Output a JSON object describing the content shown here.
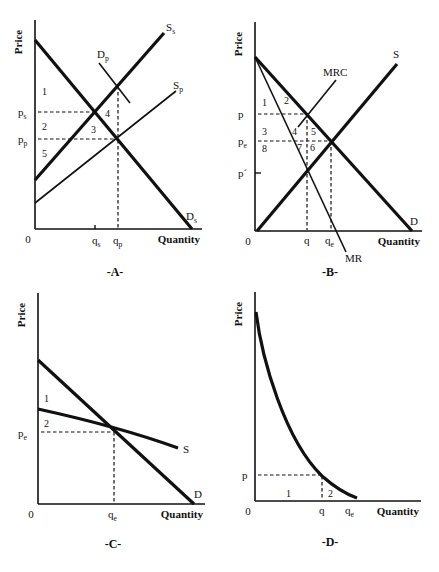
{
  "panels": [
    {
      "id": "A",
      "title": "-A-",
      "axis": {
        "ylabel": "Price",
        "xlabel": "Quantity",
        "origin": "0"
      },
      "frame": {
        "x0": 35,
        "y0": 229,
        "yTop": 20,
        "xRight": 202
      },
      "lines": [
        {
          "name": "Ds",
          "label": "D",
          "sub": "s",
          "x1": 35,
          "y1": 40,
          "x2": 192,
          "y2": 229,
          "w": 3.2,
          "lx": 186,
          "ly": 220
        },
        {
          "name": "Ss",
          "label": "S",
          "sub": "s",
          "x1": 35,
          "y1": 180,
          "x2": 164,
          "y2": 33,
          "w": 3.2,
          "lx": 166,
          "ly": 31
        },
        {
          "name": "Sp",
          "label": "S",
          "sub": "p",
          "x1": 35,
          "y1": 203,
          "x2": 176,
          "y2": 91,
          "w": 1.6,
          "lx": 173,
          "ly": 89
        },
        {
          "name": "Dp",
          "label": "D",
          "sub": "p",
          "x1": 99,
          "y1": 63,
          "x2": 130,
          "y2": 103,
          "w": 1.6,
          "lx": 97,
          "ly": 58
        }
      ],
      "dashed": [
        {
          "x1": 38,
          "y1": 112,
          "x2": 95,
          "y2": 112
        },
        {
          "x1": 38,
          "y1": 139,
          "x2": 117,
          "y2": 139
        },
        {
          "x1": 118,
          "y1": 86,
          "x2": 118,
          "y2": 228
        }
      ],
      "ticks": [
        {
          "x": 95,
          "y1": 225,
          "y2": 229
        }
      ],
      "ylabels": [
        {
          "text": "p",
          "sub": "s",
          "x": 18,
          "y": 116
        },
        {
          "text": "p",
          "sub": "p",
          "x": 18,
          "y": 143
        }
      ],
      "xlabels": [
        {
          "text": "q",
          "sub": "s",
          "x": 92,
          "y": 244
        },
        {
          "text": "q",
          "sub": "p",
          "x": 113,
          "y": 244
        }
      ],
      "regions": [
        {
          "text": "1",
          "x": 42,
          "y": 95
        },
        {
          "text": "4",
          "x": 105,
          "y": 117
        },
        {
          "text": "2",
          "x": 42,
          "y": 130
        },
        {
          "text": "3",
          "x": 91,
          "y": 133
        },
        {
          "text": "5",
          "x": 42,
          "y": 157
        }
      ],
      "titlePos": {
        "x": 115,
        "y": 276
      }
    },
    {
      "id": "B",
      "title": "-B-",
      "axis": {
        "ylabel": "Price",
        "xlabel": "Quantity",
        "origin": "0"
      },
      "frame": {
        "x0": 255,
        "y0": 231,
        "yTop": 22,
        "xRight": 422
      },
      "lines": [
        {
          "name": "D",
          "label": "D",
          "sub": "",
          "x1": 255,
          "y1": 57,
          "x2": 412,
          "y2": 231,
          "w": 3.2,
          "lx": 410,
          "ly": 225
        },
        {
          "name": "S",
          "label": "S",
          "sub": "",
          "x1": 257,
          "y1": 231,
          "x2": 397,
          "y2": 64,
          "w": 3.2,
          "lx": 393,
          "ly": 58
        },
        {
          "name": "MR",
          "label": "MR",
          "sub": "",
          "x1": 255,
          "y1": 57,
          "x2": 346,
          "y2": 252,
          "w": 1.6,
          "lx": 345,
          "ly": 262
        },
        {
          "name": "MRC",
          "label": "MRC",
          "sub": "",
          "x1": 298,
          "y1": 127,
          "x2": 336,
          "y2": 80,
          "w": 1.6,
          "lx": 323,
          "ly": 76
        }
      ],
      "dashed": [
        {
          "x1": 258,
          "y1": 114,
          "x2": 306,
          "y2": 114
        },
        {
          "x1": 258,
          "y1": 141,
          "x2": 330,
          "y2": 141
        },
        {
          "x1": 307,
          "y1": 114,
          "x2": 307,
          "y2": 230
        },
        {
          "x1": 331,
          "y1": 141,
          "x2": 331,
          "y2": 230
        }
      ],
      "ticks": [
        {
          "x1": 255,
          "x2": 261,
          "y": 173
        }
      ],
      "ylabels": [
        {
          "text": "p",
          "sub": "",
          "x": 238,
          "y": 118
        },
        {
          "text": "p",
          "sub": "e",
          "x": 238,
          "y": 145
        },
        {
          "text": "p´",
          "sub": "",
          "x": 238,
          "y": 177
        }
      ],
      "xlabels": [
        {
          "text": "q",
          "sub": "",
          "x": 304,
          "y": 244
        },
        {
          "text": "q",
          "sub": "e",
          "x": 325,
          "y": 244
        }
      ],
      "regions": [
        {
          "text": "1",
          "x": 262,
          "y": 106
        },
        {
          "text": "2",
          "x": 284,
          "y": 104
        },
        {
          "text": "3",
          "x": 262,
          "y": 135
        },
        {
          "text": "4",
          "x": 292,
          "y": 135
        },
        {
          "text": "5",
          "x": 311,
          "y": 135
        },
        {
          "text": "8",
          "x": 262,
          "y": 152
        },
        {
          "text": "7",
          "x": 297,
          "y": 151
        },
        {
          "text": "6",
          "x": 310,
          "y": 151
        }
      ],
      "titlePos": {
        "x": 330,
        "y": 276
      }
    },
    {
      "id": "C",
      "title": "-C-",
      "axis": {
        "ylabel": "Price",
        "xlabel": "Quantity",
        "origin": "0"
      },
      "frame": {
        "x0": 38,
        "y0": 504,
        "yTop": 293,
        "xRight": 205
      },
      "lines": [
        {
          "name": "D",
          "label": "D",
          "sub": "",
          "x1": 38,
          "y1": 360,
          "x2": 194,
          "y2": 504,
          "w": 3.2,
          "lx": 194,
          "ly": 498
        },
        {
          "name": "S",
          "label": "S",
          "sub": "",
          "x1": 38,
          "y1": 409,
          "x2": 178,
          "y2": 448,
          "w": 3.2,
          "lx": 183,
          "ly": 453,
          "curve": true,
          "cx": 120,
          "cy": 427
        }
      ],
      "dashed": [
        {
          "x1": 41,
          "y1": 432,
          "x2": 113,
          "y2": 432
        },
        {
          "x1": 114,
          "y1": 432,
          "x2": 114,
          "y2": 503
        }
      ],
      "ticks": [],
      "ylabels": [
        {
          "text": "p",
          "sub": "e",
          "x": 18,
          "y": 437
        }
      ],
      "xlabels": [
        {
          "text": "q",
          "sub": "e",
          "x": 108,
          "y": 518
        }
      ],
      "regions": [
        {
          "text": "1",
          "x": 44,
          "y": 402
        },
        {
          "text": "2",
          "x": 44,
          "y": 427
        }
      ],
      "titlePos": {
        "x": 113,
        "y": 548
      }
    },
    {
      "id": "D",
      "title": "-D-",
      "axis": {
        "ylabel": "Price",
        "xlabel": "Quantity",
        "origin": "0"
      },
      "frame": {
        "x0": 255,
        "y0": 501,
        "yTop": 292,
        "xRight": 421
      },
      "curve": {
        "d": "M 256 312 C 262 360, 285 440, 322 476 Q 340 492, 357 498",
        "w": 3.2
      },
      "lines": [],
      "dashed": [
        {
          "x1": 258,
          "y1": 475,
          "x2": 322,
          "y2": 475
        },
        {
          "x1": 322,
          "y1": 476,
          "x2": 322,
          "y2": 500
        }
      ],
      "ticks": [],
      "ylabels": [
        {
          "text": "p",
          "sub": "",
          "x": 242,
          "y": 479
        }
      ],
      "xlabels": [
        {
          "text": "q",
          "sub": "",
          "x": 319,
          "y": 514
        },
        {
          "text": "q",
          "sub": "e",
          "x": 345,
          "y": 514
        }
      ],
      "regions": [
        {
          "text": "1",
          "x": 286,
          "y": 497
        },
        {
          "text": "2",
          "x": 328,
          "y": 497
        }
      ],
      "titlePos": {
        "x": 330,
        "y": 546
      }
    }
  ]
}
